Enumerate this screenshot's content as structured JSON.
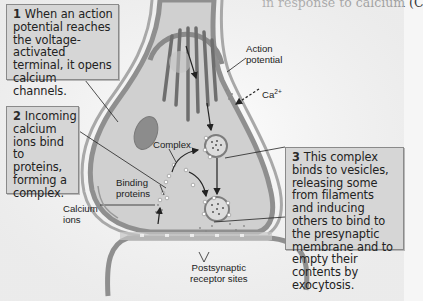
{
  "page": {
    "top_text": "in response to calcium (C"
  },
  "callouts": [
    {
      "number": "1",
      "text": "When an action potential reaches the voltage-activated terminal, it opens calcium channels."
    },
    {
      "number": "2",
      "text": "Incoming calcium ions bind to proteins, forming a complex."
    },
    {
      "number": "3",
      "text": "This complex binds to vesicles, releasing some from filaments and inducing others to bind to the presynaptic membrane and to empty their contents by exocytosis."
    }
  ],
  "labels": {
    "action_potential_line1": "Action",
    "action_potential_line2": "potential",
    "calcium_symbol": "Ca",
    "calcium_charge": "2+",
    "complex": "Complex",
    "binding_proteins_line1": "Binding",
    "binding_proteins_line2": "proteins",
    "calcium_ions_line1": "Calcium",
    "calcium_ions_line2": "ions",
    "postsynaptic_line1": "Postsynaptic",
    "postsynaptic_line2": "receptor sites"
  },
  "colors": {
    "background": "#f6f6f6",
    "callout_fill": "#d6d6d6",
    "callout_border": "#8a8a8a",
    "terminal_fill": "#cfcfcf",
    "membrane": "#8f8f8f",
    "filament": "#6e6e6e",
    "mitochondrion": "#8a8a8a"
  }
}
